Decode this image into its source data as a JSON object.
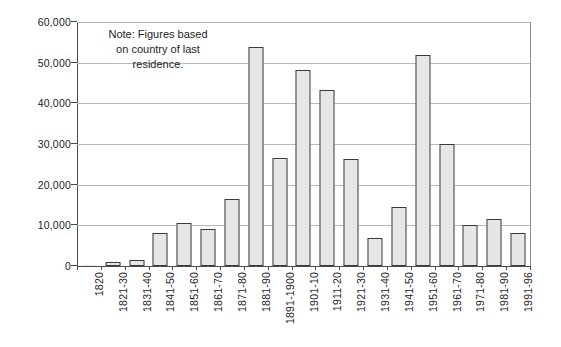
{
  "chart_data": {
    "type": "bar",
    "title": "",
    "subtitle": "",
    "xlabel": "",
    "ylabel": "",
    "ylim": [
      0,
      60000
    ],
    "ytick_step": 10000,
    "grid": true,
    "legend": null,
    "annotations": [
      "Note: Figures based on country of last residence."
    ],
    "ytick_labels": [
      "0",
      "10,000",
      "20,000",
      "30,000",
      "40,000",
      "50,000",
      "60,000"
    ],
    "ytick_values": [
      0,
      10000,
      20000,
      30000,
      40000,
      50000,
      60000
    ],
    "categories": [
      "1820",
      "1821-30",
      "1831-40",
      "1841-50",
      "1851-60",
      "1861-70",
      "1871-80",
      "1881-90",
      "1891-1900",
      "1901-10",
      "1911-20",
      "1921-30",
      "1931-40",
      "1941-50",
      "1951-60",
      "1961-70",
      "1971-80",
      "1981-90",
      "1991-96"
    ],
    "values": [
      150,
      1000,
      1500,
      8100,
      10700,
      9000,
      16400,
      53800,
      26500,
      48200,
      43400,
      26400,
      6900,
      14400,
      52000,
      30100,
      10100,
      11600,
      8100
    ],
    "bar_fill": "#e6e6e6",
    "bar_border": "#3a3a3a",
    "gridline_color": "#b9b9b9",
    "axis_color": "#4a4a4a"
  },
  "note": {
    "line1": "Note: Figures based",
    "line2": "on country of last",
    "line3": "residence."
  }
}
